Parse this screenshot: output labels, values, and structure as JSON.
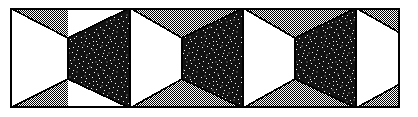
{
  "figure": {
    "title": "Zigzag folded band optical illusion",
    "type": "line-art-figure",
    "width": 418,
    "height": 117
  },
  "frame": {
    "name": "outer-frame",
    "x": 10,
    "y": 8,
    "width": 390,
    "height": 100,
    "stroke_color": "#000000",
    "stroke_width": 1.6,
    "fill_color": "#ffffff"
  },
  "palette": {
    "background": "#ffffff",
    "ink": "#000000",
    "white_face": "#ffffff",
    "gray_dither": "#808080",
    "dark_stipple_base": "#151515",
    "dark_stipple_speckle": "#ffffff"
  },
  "geometry": {
    "band_left": 10,
    "band_right": 400,
    "band_top": 8,
    "band_bottom": 108,
    "period": 113,
    "fold_top_y": 38,
    "fold_bottom_y": 79,
    "panel_outline_width": 1.6,
    "note": "Upper gray wedges occupy the band between the top edge and the rising/falling fold line; lower gray wedges mirror them along the bottom edge."
  },
  "panels": [
    {
      "index": 0,
      "kind": "white-face",
      "label": "white-panel-1",
      "points": "10,8 10,108 68,79 68,38",
      "fill": "#ffffff",
      "clipped_left": true
    },
    {
      "index": 1,
      "kind": "dark-stipple-face",
      "label": "dark-panel-1",
      "points": "68,38 130,8 130,108 68,79",
      "fill": "stipple"
    },
    {
      "index": 2,
      "kind": "white-face",
      "label": "white-panel-2",
      "points": "130,8 182,38 182,79 130,108",
      "fill": "#ffffff"
    },
    {
      "index": 3,
      "kind": "dark-stipple-face",
      "label": "dark-panel-2",
      "points": "182,38 243,8 243,108 182,79",
      "fill": "stipple"
    },
    {
      "index": 4,
      "kind": "white-face",
      "label": "white-panel-3",
      "points": "243,8 295,38 295,79 243,108",
      "fill": "#ffffff"
    },
    {
      "index": 5,
      "kind": "dark-stipple-face",
      "label": "dark-panel-3",
      "points": "295,38 356,8 356,108 295,79",
      "fill": "stipple"
    },
    {
      "index": 6,
      "kind": "white-face",
      "label": "white-panel-4",
      "points": "356,8 400,33 400,84 356,108",
      "fill": "#ffffff",
      "clipped_right": true
    }
  ],
  "gray_wedges": [
    {
      "label": "top-wedge-1",
      "points": "10,8 68,38 68,8"
    },
    {
      "label": "top-wedge-2",
      "points": "130,8 182,38 243,8"
    },
    {
      "label": "top-wedge-3",
      "points": "243,8 295,38 356,8"
    },
    {
      "label": "top-wedge-4",
      "points": "356,8 400,33 400,8"
    },
    {
      "label": "bottom-wedge-1",
      "points": "10,108 68,79 68,108"
    },
    {
      "label": "bottom-wedge-2",
      "points": "130,108 182,79 243,108"
    },
    {
      "label": "bottom-wedge-3",
      "points": "243,108 295,79 356,108"
    },
    {
      "label": "bottom-wedge-4",
      "points": "356,108 400,84 400,108"
    }
  ],
  "fold_lines": [
    {
      "label": "fold-line-top",
      "points": "10,8 68,38 130,8 182,38 243,8 295,38 356,8 400,33"
    },
    {
      "label": "fold-line-bottom",
      "points": "10,108 68,79 130,108 182,79 243,108 295,79 356,108 400,84"
    },
    {
      "label": "ridge-1",
      "x": 68,
      "y1": 38,
      "y2": 79
    },
    {
      "label": "ridge-2",
      "x": 130,
      "y1": 8,
      "y2": 108
    },
    {
      "label": "ridge-3",
      "x": 182,
      "y1": 38,
      "y2": 79
    },
    {
      "label": "ridge-4",
      "x": 243,
      "y1": 8,
      "y2": 108
    },
    {
      "label": "ridge-5",
      "x": 295,
      "y1": 38,
      "y2": 79
    },
    {
      "label": "ridge-6",
      "x": 356,
      "y1": 8,
      "y2": 108
    }
  ]
}
